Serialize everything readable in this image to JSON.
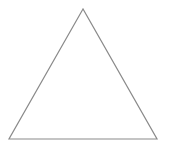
{
  "diagram": {
    "shape": "triangle",
    "type": "equilateral",
    "stroke_color": "#8a8a8a",
    "fill_color": "#ffffff",
    "stroke_width": 1.2,
    "vertices": {
      "apex": [
        83,
        9
      ],
      "bottom_left": [
        9,
        139
      ],
      "bottom_right": [
        157,
        139
      ]
    }
  }
}
